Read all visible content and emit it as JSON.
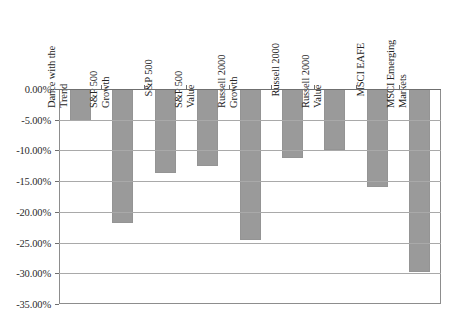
{
  "figure": {
    "title_sliver": "",
    "background_color": "#ffffff",
    "bar_color": "#9a9a9a",
    "gridline_color": "#a9a9a9",
    "axis_color": "#6f6f6f"
  },
  "chart_data": {
    "type": "bar",
    "title": "",
    "subtitle": "",
    "xlabel": "",
    "ylabel": "",
    "orientation": "vertical",
    "grid": true,
    "legend": "none",
    "ylim": [
      -35.0,
      0.0
    ],
    "ytick_labels": [
      "0.00%",
      "-5.00%",
      "-10.00%",
      "-15.00%",
      "-20.00%",
      "-25.00%",
      "-30.00%",
      "-35.00%"
    ],
    "ytick_values": [
      0.0,
      -5.0,
      -10.0,
      -15.0,
      -20.0,
      -25.0,
      -30.0,
      -35.0
    ],
    "value_unit": "percent",
    "categories": [
      "Dance with the Trend",
      "S&P 500 Growth",
      "S&P 500",
      "S&P 500 Value",
      "Russell 2000 Growth",
      "Russell 2000",
      "Russell 2000 Value",
      "MSCI EAFE",
      "MSCI Emerging Markets"
    ],
    "category_lines": [
      [
        "Dance with the",
        "Trend"
      ],
      [
        "S&P 500",
        "Growth"
      ],
      [
        "S&P 500"
      ],
      [
        "S&P 500",
        "Value"
      ],
      [
        "Russell 2000",
        "Growth"
      ],
      [
        "Russell 2000"
      ],
      [
        "Russell 2000",
        "Value"
      ],
      [
        "MSCI EAFE"
      ],
      [
        "MSCI Emerging",
        "Markets"
      ]
    ],
    "values": [
      -5.2,
      -21.8,
      -13.6,
      -12.6,
      -24.5,
      -11.2,
      -10.0,
      -16.0,
      -29.8
    ]
  }
}
